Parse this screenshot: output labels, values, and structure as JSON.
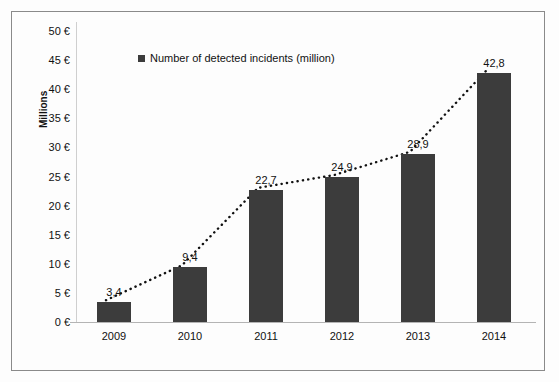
{
  "chart_data": {
    "type": "bar",
    "title": "",
    "xlabel": "",
    "ylabel": "Millions",
    "categories": [
      "2009",
      "2010",
      "2011",
      "2012",
      "2013",
      "2014"
    ],
    "values": [
      3.4,
      9.4,
      22.7,
      24.9,
      28.9,
      42.8
    ],
    "value_labels": [
      "3,4",
      "9,4",
      "22,7",
      "24,9",
      "28,9",
      "42,8"
    ],
    "ylim": [
      0,
      50
    ],
    "ytick_values": [
      0,
      5,
      10,
      15,
      20,
      25,
      30,
      35,
      40,
      45,
      50
    ],
    "ytick_labels": [
      "0 €",
      "5 €",
      "10 €",
      "15 €",
      "20 €",
      "25 €",
      "30 €",
      "35 €",
      "40 €",
      "45 €",
      "50 €"
    ],
    "grid": false,
    "legend_position": "top-left",
    "series": [
      {
        "name": "Number of detected incidents (million)",
        "values": [
          3.4,
          9.4,
          22.7,
          24.9,
          28.9,
          42.8
        ],
        "color": "#3c3c3c"
      }
    ],
    "annotations": [
      {
        "type": "trendline",
        "style": "dotted",
        "color": "#111111"
      }
    ]
  },
  "legend": {
    "label": "Number of detected incidents (million)",
    "swatch_color": "#3c3c3c"
  },
  "axis": {
    "y_title": "Millions"
  },
  "colors": {
    "bar": "#3c3c3c",
    "frame": "#8a8a8a",
    "background": "#fdfdfd",
    "text": "#111111"
  }
}
